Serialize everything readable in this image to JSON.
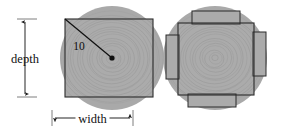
{
  "figure": {
    "colors": {
      "log_fill": "#a9a9a9",
      "board_fill": "#ababab",
      "grain_line": "#9a9a9a",
      "outline": "#2b2b2b",
      "dimension_line": "#1a1a1a",
      "text": "#111111",
      "background": "#ffffff"
    },
    "panels": [
      {
        "id": "left-panel",
        "name": "max-rectangle-panel",
        "log": {
          "cx": 112,
          "cy": 58,
          "r": 52
        },
        "board": {
          "x": 65,
          "y": 19,
          "width": 88,
          "height": 78
        },
        "radius_line": {
          "x1": 65,
          "y1": 19,
          "x2": 112,
          "y2": 58
        },
        "center_dot": {
          "cx": 112,
          "cy": 58,
          "r": 2.6
        },
        "labels": {
          "radius": "10",
          "depth": "depth",
          "width": "width"
        },
        "dimensions": {
          "depth_line": {
            "x": 25,
            "y1": 19,
            "y2": 97
          },
          "depth_tick_top": {
            "x1": 17,
            "x2": 37,
            "y": 19
          },
          "depth_tick_bottom": {
            "x1": 17,
            "x2": 37,
            "y": 97
          },
          "width_line": {
            "y": 118,
            "x1": 52,
            "x2": 133
          },
          "width_tick_left": {
            "x": 52,
            "y1": 110,
            "y2": 126
          },
          "width_tick_right": {
            "x": 133,
            "y1": 110,
            "y2": 126
          }
        }
      },
      {
        "id": "right-panel",
        "name": "tenoned-rectangle-panel",
        "log": {
          "cx": 215,
          "cy": 58,
          "r": 52
        },
        "board": {
          "x": 178,
          "y": 23,
          "width": 76,
          "height": 72
        },
        "tenons": [
          {
            "name": "top-tenon",
            "x": 192,
            "y": 11,
            "width": 48,
            "height": 13
          },
          {
            "name": "bottom-tenon",
            "x": 188,
            "y": 94,
            "width": 48,
            "height": 13
          },
          {
            "name": "left-tenon",
            "x": 166,
            "y": 35,
            "width": 13,
            "height": 44
          },
          {
            "name": "right-tenon",
            "x": 253,
            "y": 32,
            "width": 13,
            "height": 44
          }
        ]
      }
    ]
  }
}
